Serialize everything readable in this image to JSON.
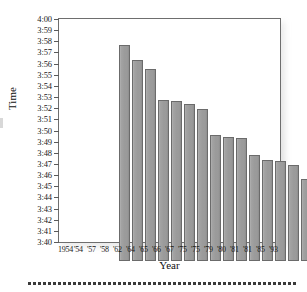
{
  "figure": {
    "y_axis_title": "Time",
    "x_axis_title": "Year"
  },
  "chart_data": {
    "type": "bar",
    "title": "",
    "xlabel": "Year",
    "ylabel": "Time",
    "categories": [
      "1954",
      "'54",
      "'57",
      "'58",
      "'62",
      "'64",
      "'65",
      "'66",
      "'67",
      "'75",
      "'75",
      "'79",
      "'80",
      "'81",
      "'81",
      "'85",
      "'93"
    ],
    "values": [
      3.99,
      3.967,
      3.954,
      3.908,
      3.906,
      3.902,
      3.894,
      3.855,
      3.852,
      3.85,
      3.825,
      3.817,
      3.816,
      3.81,
      3.79,
      3.773,
      3.743
    ],
    "value_labels": [
      "3:59.4",
      "3:58.0",
      "3:57.2",
      "3:54.5",
      "3:54.4",
      "3:54.1",
      "3:53.6",
      "3:51.3",
      "3:51.1",
      "3:51.0",
      "3:49.5",
      "3:49.0",
      "3:48.9",
      "3:48.6",
      "3:47.4",
      "3:46.4",
      "3:44.6"
    ],
    "ylim": [
      3.6667,
      4.0
    ],
    "ytick_labels": [
      "4:00",
      "3:59",
      "3:58",
      "3:57",
      "3:56",
      "3:55",
      "3:54",
      "3:53",
      "3:52",
      "3:51",
      "3:50",
      "3:49",
      "3:48",
      "3:47",
      "3:46",
      "3:45",
      "3:44",
      "3:43",
      "3:42",
      "3:41",
      "3:40"
    ],
    "ytick_values": [
      4.0,
      3.9833,
      3.9667,
      3.95,
      3.9333,
      3.9167,
      3.9,
      3.8833,
      3.8667,
      3.85,
      3.8333,
      3.8167,
      3.8,
      3.7833,
      3.7667,
      3.75,
      3.7333,
      3.7167,
      3.7,
      3.6833,
      3.6667
    ],
    "grid": false,
    "legend": false,
    "bar_color": "#9a9a9a",
    "bar_edge_color": "#6b6b6b",
    "axis_color": "#6e6e6e",
    "background_color": "#ffffff"
  },
  "decoration": {
    "dot_count": 54,
    "dot_color": "#3a3a3a"
  }
}
